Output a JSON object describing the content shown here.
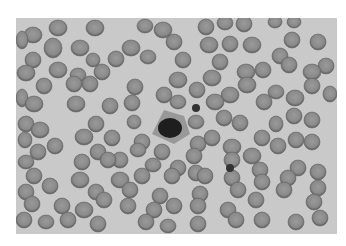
{
  "image": {
    "subject": "Blood smear micrograph (grayscale)",
    "background_color": "#c9c9c9",
    "cell_fill": "#8a8a8a",
    "cell_rim": "#5a5a5a",
    "frame": {
      "x": 16,
      "y": 18,
      "width": 321,
      "height": 216
    }
  },
  "cells": [
    [
      33,
      35,
      9,
      8
    ],
    [
      58,
      28,
      9,
      8
    ],
    [
      95,
      28,
      9,
      8
    ],
    [
      145,
      26,
      8,
      7
    ],
    [
      163,
      30,
      9,
      8
    ],
    [
      206,
      27,
      8,
      8
    ],
    [
      225,
      23,
      8,
      7
    ],
    [
      244,
      24,
      8,
      8
    ],
    [
      275,
      22,
      7,
      6
    ],
    [
      294,
      22,
      7,
      6
    ],
    [
      22,
      40,
      6,
      9
    ],
    [
      53,
      48,
      9,
      10
    ],
    [
      80,
      48,
      9,
      8
    ],
    [
      131,
      48,
      9,
      8
    ],
    [
      174,
      42,
      8,
      8
    ],
    [
      209,
      45,
      9,
      8
    ],
    [
      230,
      44,
      8,
      8
    ],
    [
      252,
      45,
      9,
      8
    ],
    [
      292,
      40,
      8,
      8
    ],
    [
      318,
      42,
      8,
      8
    ],
    [
      33,
      60,
      8,
      8
    ],
    [
      93,
      60,
      7,
      7
    ],
    [
      116,
      59,
      8,
      8
    ],
    [
      148,
      57,
      8,
      7
    ],
    [
      183,
      60,
      8,
      8
    ],
    [
      220,
      62,
      8,
      8
    ],
    [
      280,
      56,
      8,
      8
    ],
    [
      289,
      65,
      8,
      8
    ],
    [
      326,
      66,
      8,
      8
    ],
    [
      26,
      73,
      9,
      8
    ],
    [
      58,
      70,
      9,
      8
    ],
    [
      78,
      75,
      8,
      7
    ],
    [
      102,
      72,
      8,
      8
    ],
    [
      178,
      80,
      9,
      8
    ],
    [
      212,
      78,
      9,
      8
    ],
    [
      246,
      72,
      9,
      8
    ],
    [
      263,
      70,
      8,
      8
    ],
    [
      312,
      72,
      9,
      8
    ],
    [
      44,
      86,
      8,
      8
    ],
    [
      74,
      84,
      8,
      8
    ],
    [
      90,
      84,
      8,
      8
    ],
    [
      135,
      87,
      8,
      8
    ],
    [
      164,
      95,
      8,
      8
    ],
    [
      197,
      90,
      8,
      8
    ],
    [
      230,
      95,
      9,
      8
    ],
    [
      247,
      85,
      9,
      8
    ],
    [
      276,
      92,
      8,
      7
    ],
    [
      312,
      86,
      8,
      8
    ],
    [
      330,
      94,
      7,
      8
    ],
    [
      22,
      98,
      6,
      9
    ],
    [
      34,
      104,
      9,
      8
    ],
    [
      76,
      104,
      9,
      8
    ],
    [
      110,
      106,
      8,
      8
    ],
    [
      132,
      103,
      8,
      8
    ],
    [
      178,
      102,
      8,
      7
    ],
    [
      215,
      102,
      9,
      8
    ],
    [
      264,
      102,
      8,
      8
    ],
    [
      295,
      98,
      9,
      8
    ],
    [
      26,
      124,
      8,
      8
    ],
    [
      40,
      130,
      9,
      8
    ],
    [
      96,
      124,
      8,
      8
    ],
    [
      134,
      122,
      7,
      7
    ],
    [
      196,
      122,
      8,
      7
    ],
    [
      224,
      118,
      8,
      8
    ],
    [
      240,
      123,
      8,
      8
    ],
    [
      276,
      124,
      7,
      8
    ],
    [
      294,
      116,
      8,
      8
    ],
    [
      312,
      120,
      8,
      8
    ],
    [
      25,
      140,
      7,
      8
    ],
    [
      55,
      146,
      8,
      8
    ],
    [
      84,
      137,
      9,
      8
    ],
    [
      112,
      138,
      8,
      8
    ],
    [
      142,
      142,
      8,
      8
    ],
    [
      198,
      144,
      8,
      8
    ],
    [
      212,
      138,
      8,
      8
    ],
    [
      232,
      147,
      9,
      8
    ],
    [
      262,
      138,
      8,
      8
    ],
    [
      296,
      140,
      8,
      8
    ],
    [
      312,
      142,
      8,
      8
    ],
    [
      38,
      152,
      8,
      8
    ],
    [
      98,
      152,
      8,
      8
    ],
    [
      120,
      160,
      8,
      8
    ],
    [
      138,
      150,
      8,
      7
    ],
    [
      162,
      152,
      8,
      8
    ],
    [
      194,
      156,
      8,
      8
    ],
    [
      232,
      160,
      8,
      8
    ],
    [
      252,
      156,
      9,
      8
    ],
    [
      278,
      146,
      8,
      8
    ],
    [
      26,
      162,
      8,
      7
    ],
    [
      82,
      162,
      8,
      8
    ],
    [
      108,
      160,
      8,
      8
    ],
    [
      153,
      165,
      8,
      7
    ],
    [
      178,
      168,
      8,
      8
    ],
    [
      196,
      173,
      8,
      8
    ],
    [
      260,
      170,
      8,
      8
    ],
    [
      298,
      168,
      8,
      8
    ],
    [
      318,
      172,
      8,
      8
    ],
    [
      34,
      176,
      8,
      8
    ],
    [
      50,
      186,
      8,
      8
    ],
    [
      80,
      180,
      9,
      8
    ],
    [
      120,
      180,
      9,
      8
    ],
    [
      142,
      176,
      8,
      8
    ],
    [
      172,
      176,
      8,
      8
    ],
    [
      205,
      176,
      8,
      8
    ],
    [
      232,
      178,
      8,
      8
    ],
    [
      262,
      182,
      8,
      8
    ],
    [
      288,
      178,
      8,
      8
    ],
    [
      26,
      192,
      8,
      8
    ],
    [
      96,
      192,
      8,
      8
    ],
    [
      130,
      190,
      8,
      8
    ],
    [
      160,
      196,
      8,
      8
    ],
    [
      200,
      194,
      8,
      8
    ],
    [
      238,
      190,
      8,
      8
    ],
    [
      284,
      190,
      8,
      8
    ],
    [
      318,
      188,
      8,
      8
    ],
    [
      32,
      204,
      8,
      8
    ],
    [
      62,
      206,
      8,
      8
    ],
    [
      84,
      210,
      9,
      8
    ],
    [
      104,
      200,
      8,
      8
    ],
    [
      128,
      206,
      8,
      8
    ],
    [
      154,
      210,
      8,
      8
    ],
    [
      174,
      206,
      8,
      8
    ],
    [
      198,
      206,
      8,
      8
    ],
    [
      228,
      210,
      8,
      8
    ],
    [
      256,
      200,
      8,
      8
    ],
    [
      314,
      202,
      8,
      8
    ],
    [
      24,
      220,
      8,
      8
    ],
    [
      46,
      222,
      8,
      7
    ],
    [
      68,
      220,
      8,
      8
    ],
    [
      98,
      224,
      8,
      8
    ],
    [
      146,
      222,
      8,
      8
    ],
    [
      168,
      226,
      8,
      7
    ],
    [
      198,
      224,
      8,
      8
    ],
    [
      236,
      220,
      8,
      8
    ],
    [
      262,
      220,
      8,
      8
    ],
    [
      296,
      222,
      8,
      8
    ],
    [
      320,
      218,
      8,
      8
    ]
  ],
  "special": {
    "white_cell": {
      "x": 170,
      "y": 128,
      "nucleus_rx": 12,
      "nucleus_ry": 10,
      "cytoplasm_color": "#8f8f8f",
      "nucleus_color": "#1e1e1e"
    },
    "platelets": [
      [
        196,
        108,
        4
      ],
      [
        230,
        168,
        4
      ]
    ]
  }
}
